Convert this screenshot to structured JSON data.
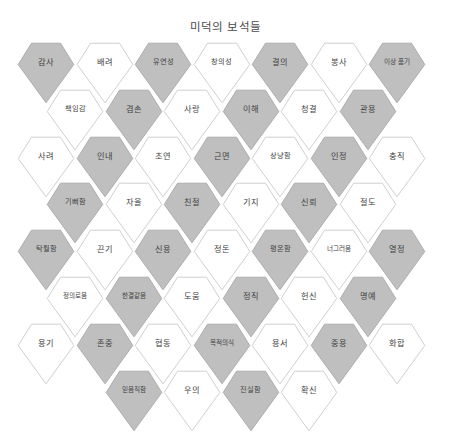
{
  "title": "미덕의 보석들",
  "colors": {
    "filled_fill": "#bfbfbf",
    "filled_stroke": "#a8a8a8",
    "empty_fill": "#ffffff",
    "empty_stroke": "#c9c9c9",
    "label_text": "#3f3f3f",
    "title_text": "#4a4a4a",
    "background": "#ffffff"
  },
  "diagram": {
    "type": "gem-grid",
    "shape": "diamond",
    "rows": [
      {
        "index": 1,
        "offset": false,
        "gems": [
          {
            "label": "감사",
            "filled": true
          },
          {
            "label": "배려",
            "filled": false
          },
          {
            "label": "유연성",
            "filled": true
          },
          {
            "label": "창의성",
            "filled": false
          },
          {
            "label": "결의",
            "filled": true
          },
          {
            "label": "봉사",
            "filled": false
          },
          {
            "label": "이상 품기",
            "filled": true
          }
        ]
      },
      {
        "index": 2,
        "offset": true,
        "gems": [
          {
            "label": "책임감",
            "filled": false
          },
          {
            "label": "겸손",
            "filled": true
          },
          {
            "label": "사랑",
            "filled": false
          },
          {
            "label": "이해",
            "filled": true
          },
          {
            "label": "청결",
            "filled": false
          },
          {
            "label": "관용",
            "filled": true
          }
        ]
      },
      {
        "index": 3,
        "offset": false,
        "gems": [
          {
            "label": "사려",
            "filled": false
          },
          {
            "label": "인내",
            "filled": true
          },
          {
            "label": "초연",
            "filled": false
          },
          {
            "label": "근면",
            "filled": true
          },
          {
            "label": "상냥함",
            "filled": false
          },
          {
            "label": "인정",
            "filled": true
          },
          {
            "label": "충직",
            "filled": false
          }
        ]
      },
      {
        "index": 4,
        "offset": true,
        "gems": [
          {
            "label": "기뻐함",
            "filled": true
          },
          {
            "label": "자율",
            "filled": false
          },
          {
            "label": "친절",
            "filled": true
          },
          {
            "label": "기지",
            "filled": false
          },
          {
            "label": "신뢰",
            "filled": true
          },
          {
            "label": "절도",
            "filled": false
          }
        ]
      },
      {
        "index": 5,
        "offset": false,
        "gems": [
          {
            "label": "탁월함",
            "filled": true
          },
          {
            "label": "끈기",
            "filled": false
          },
          {
            "label": "신용",
            "filled": true
          },
          {
            "label": "정돈",
            "filled": false
          },
          {
            "label": "평온함",
            "filled": true
          },
          {
            "label": "너그러움",
            "filled": false
          },
          {
            "label": "열정",
            "filled": true
          }
        ]
      },
      {
        "index": 6,
        "offset": true,
        "gems": [
          {
            "label": "정의로움",
            "filled": false
          },
          {
            "label": "한결같음",
            "filled": true
          },
          {
            "label": "도움",
            "filled": false
          },
          {
            "label": "정직",
            "filled": true
          },
          {
            "label": "헌신",
            "filled": false
          },
          {
            "label": "명예",
            "filled": true
          }
        ]
      },
      {
        "index": 7,
        "offset": false,
        "gems": [
          {
            "label": "용기",
            "filled": false
          },
          {
            "label": "존중",
            "filled": true
          },
          {
            "label": "협동",
            "filled": false
          },
          {
            "label": "목적의식",
            "filled": true
          },
          {
            "label": "용서",
            "filled": false
          },
          {
            "label": "중용",
            "filled": true
          },
          {
            "label": "화합",
            "filled": false
          }
        ]
      },
      {
        "index": 8,
        "offset": true,
        "start_column": 1,
        "gems": [
          {
            "label": "믿음직함",
            "filled": true
          },
          {
            "label": "우의",
            "filled": false
          },
          {
            "label": "진실함",
            "filled": true
          },
          {
            "label": "확신",
            "filled": false
          }
        ]
      }
    ]
  }
}
